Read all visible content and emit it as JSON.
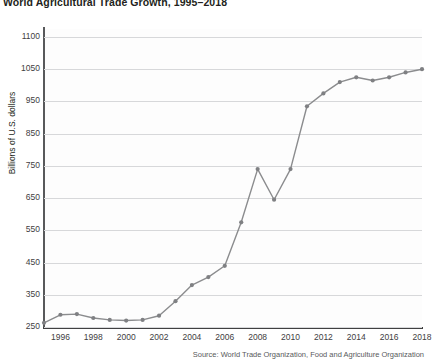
{
  "chart_data": {
    "type": "line",
    "title": "World Agricultural Trade Growth, 1995–2018",
    "xlabel": "",
    "ylabel": "Billions of U.S. dollars",
    "ylim": [
      250,
      1100
    ],
    "xlim": [
      1995,
      2018
    ],
    "grid": true,
    "legend": null,
    "line_color": "#8b8c8e",
    "marker_color": "#7f8083",
    "source": "Source: World Trade Organization, Food and Agriculture Organization",
    "ytick_labels": [
      "1100",
      "1050",
      "950",
      "850",
      "750",
      "650",
      "550",
      "450",
      "350",
      "250"
    ],
    "ytick_values": [
      1100,
      1050,
      950,
      850,
      750,
      650,
      550,
      450,
      350,
      250
    ],
    "xtick_labels": [
      "1996",
      "1998",
      "2000",
      "2002",
      "2004",
      "2006",
      "2008",
      "2010",
      "2012",
      "2014",
      "2016",
      "2018"
    ],
    "xtick_values": [
      1996,
      1998,
      2000,
      2002,
      2004,
      2006,
      2008,
      2010,
      2012,
      2014,
      2016,
      2018
    ],
    "x": [
      1995,
      1996,
      1997,
      1998,
      1999,
      2000,
      2001,
      2002,
      2003,
      2004,
      2005,
      2006,
      2007,
      2008,
      2009,
      2010,
      2011,
      2012,
      2013,
      2014,
      2015,
      2016,
      2017,
      2018
    ],
    "values": [
      263,
      288,
      290,
      278,
      272,
      270,
      272,
      285,
      330,
      380,
      405,
      440,
      575,
      740,
      645,
      740,
      935,
      975,
      1010,
      1025,
      1015,
      1025,
      1040,
      1050
    ],
    "series": [
      {
        "name": "World agricultural trade",
        "values": [
          263,
          288,
          290,
          278,
          272,
          270,
          272,
          285,
          330,
          380,
          405,
          440,
          575,
          740,
          645,
          740,
          935,
          975,
          1010,
          1025,
          1015,
          1025,
          1040,
          1050
        ]
      }
    ]
  }
}
